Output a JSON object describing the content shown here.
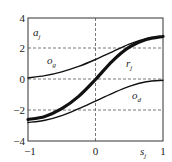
{
  "chart_data": {
    "type": "line",
    "title": "",
    "xlabel": "s_j",
    "ylabel": "a_j",
    "xlim": [
      -1,
      1
    ],
    "ylim": [
      -4,
      4
    ],
    "xticks": [
      "-1",
      "0",
      "1"
    ],
    "yticks": [
      "4",
      "2",
      "0",
      "-2",
      "-4"
    ],
    "grid": "dashed lines at y=2, y=0, y=-2 and x=0",
    "legend": "none (inline curve labels)",
    "series": [
      {
        "name": "r_j",
        "style": "thick",
        "x": [
          -1,
          -0.75,
          -0.5,
          -0.25,
          0,
          0.25,
          0.5,
          0.75,
          1
        ],
        "y": [
          -2.6,
          -2.4,
          -1.9,
          -1.1,
          0.0,
          1.2,
          2.1,
          2.6,
          2.8
        ]
      },
      {
        "name": "o_g",
        "style": "thin",
        "x": [
          -1,
          -0.75,
          -0.5,
          -0.25,
          0,
          0.25,
          0.5,
          0.75,
          1
        ],
        "y": [
          0.1,
          0.25,
          0.5,
          0.85,
          1.3,
          1.8,
          2.3,
          2.65,
          2.8
        ]
      },
      {
        "name": "o_d",
        "style": "thin",
        "x": [
          -1,
          -0.75,
          -0.5,
          -0.25,
          0,
          0.25,
          0.5,
          0.75,
          1
        ],
        "y": [
          -2.8,
          -2.65,
          -2.35,
          -1.9,
          -1.4,
          -0.9,
          -0.45,
          -0.15,
          -0.05
        ]
      }
    ],
    "annotations": [
      {
        "text": "a_j",
        "x": -0.85,
        "y": 3.0
      },
      {
        "text": "o_g",
        "x": -0.6,
        "y": 1.0
      },
      {
        "text": "r_j",
        "x": 0.55,
        "y": 1.1
      },
      {
        "text": "o_d",
        "x": 0.55,
        "y": -1.1
      },
      {
        "text": "s_j",
        "x": 0.7,
        "y": -4.6
      }
    ]
  },
  "labels": {
    "y_axis_main": "a",
    "y_axis_sub": "j",
    "x_axis_main": "s",
    "x_axis_sub": "j",
    "og_main": "o",
    "og_sub": "g",
    "rj_main": "r",
    "rj_sub": "j",
    "od_main": "o",
    "od_sub": "d"
  },
  "ticks": {
    "y": [
      "4",
      "2",
      "0",
      "−2",
      "−4"
    ],
    "x": [
      "−1",
      "0",
      "1"
    ]
  }
}
